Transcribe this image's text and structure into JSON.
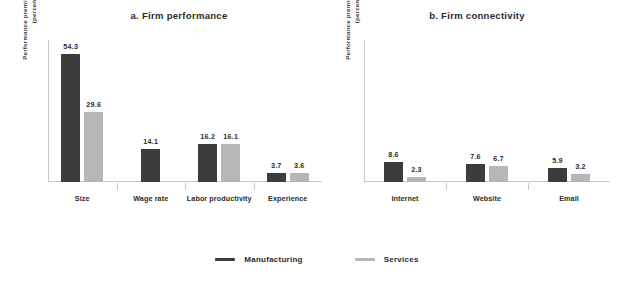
{
  "chart_data": {
    "type": "bar",
    "title": "",
    "legend": {
      "position": "bottom",
      "entries": [
        {
          "name": "Manufacturing",
          "color": "#3c3c3c"
        },
        {
          "name": "Services",
          "color": "#b6b6b6"
        }
      ]
    },
    "ylim": [
      0,
      60
    ],
    "grid": false,
    "panels": [
      {
        "id": "a",
        "title": "a. Firm performance",
        "ylabel": "Performance premium of male-owned firms (percentage points)",
        "xlabel": "",
        "categories": [
          "Size",
          "Wage rate",
          "Labor productivity",
          "Experience"
        ],
        "series": [
          {
            "name": "Manufacturing",
            "color": "#3c3c3c",
            "values": [
              54.3,
              14.1,
              16.2,
              3.7
            ]
          },
          {
            "name": "Services",
            "color": "#b6b6b6",
            "values": [
              29.6,
              null,
              16.1,
              3.6
            ]
          }
        ]
      },
      {
        "id": "b",
        "title": "b. Firm connectivity",
        "ylabel": "Performance premium of male-owned firms (percentage points)",
        "xlabel": "",
        "categories": [
          "Internet",
          "Website",
          "Email"
        ],
        "series": [
          {
            "name": "Manufacturing",
            "color": "#3c3c3c",
            "values": [
              8.6,
              7.6,
              5.9
            ]
          },
          {
            "name": "Services",
            "color": "#b6b6b6",
            "values": [
              2.3,
              6.7,
              3.2
            ]
          }
        ]
      }
    ]
  }
}
